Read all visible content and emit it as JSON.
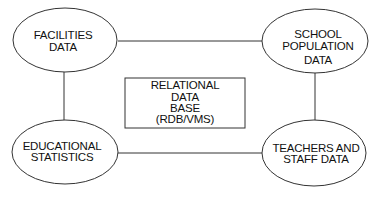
{
  "diagram": {
    "type": "entity-relationship",
    "center": {
      "shape": "rectangle",
      "lines": [
        "RELATIONAL",
        "DATA",
        "BASE",
        "(RDB/VMS)"
      ]
    },
    "nodes": [
      {
        "id": "facilities",
        "shape": "ellipse",
        "lines": [
          "FACILITIES",
          "DATA"
        ]
      },
      {
        "id": "school-population",
        "shape": "ellipse",
        "lines": [
          "SCHOOL",
          "POPULATION",
          "DATA"
        ]
      },
      {
        "id": "educational-statistics",
        "shape": "ellipse",
        "lines": [
          "EDUCATIONAL",
          "STATISTICS"
        ]
      },
      {
        "id": "teachers-staff",
        "shape": "ellipse",
        "lines": [
          "TEACHERS AND",
          "STAFF DATA"
        ]
      }
    ],
    "edges": [
      [
        "facilities",
        "school-population"
      ],
      [
        "facilities",
        "educational-statistics"
      ],
      [
        "school-population",
        "teachers-staff"
      ],
      [
        "educational-statistics",
        "teachers-staff"
      ]
    ],
    "colors": {
      "stroke": "#333333",
      "text": "#111111",
      "background": "#ffffff"
    }
  }
}
